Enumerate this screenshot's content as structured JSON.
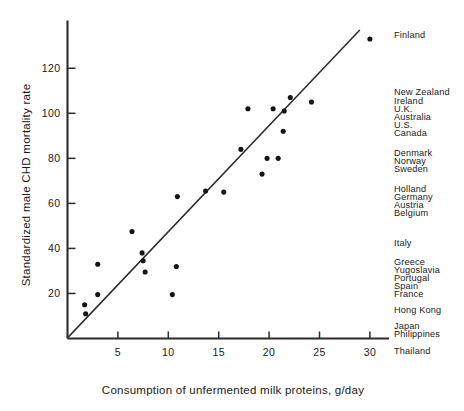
{
  "chart_data": {
    "type": "scatter",
    "title": "",
    "xlabel": "Consumption of unfermented milk proteins, g/day",
    "ylabel": "Standardized male CHD mortality rate",
    "xlim": [
      0,
      33
    ],
    "ylim": [
      0,
      140
    ],
    "xticks": [
      5,
      10,
      15,
      20,
      25,
      30
    ],
    "yticks": [
      20,
      40,
      60,
      80,
      100,
      120
    ],
    "grid": false,
    "legend": "none",
    "annotation_column_title": "",
    "points": [
      {
        "x": 1.7,
        "y": 15
      },
      {
        "x": 1.8,
        "y": 11
      },
      {
        "x": 3.0,
        "y": 19.5
      },
      {
        "x": 3.0,
        "y": 33
      },
      {
        "x": 6.4,
        "y": 47.5
      },
      {
        "x": 7.4,
        "y": 38
      },
      {
        "x": 7.5,
        "y": 34.5
      },
      {
        "x": 7.7,
        "y": 29.5
      },
      {
        "x": 10.4,
        "y": 19.5
      },
      {
        "x": 10.8,
        "y": 32
      },
      {
        "x": 10.9,
        "y": 63
      },
      {
        "x": 13.7,
        "y": 65.5
      },
      {
        "x": 15.5,
        "y": 65
      },
      {
        "x": 17.2,
        "y": 84
      },
      {
        "x": 17.9,
        "y": 102
      },
      {
        "x": 19.3,
        "y": 73
      },
      {
        "x": 19.8,
        "y": 80
      },
      {
        "x": 20.4,
        "y": 102
      },
      {
        "x": 20.9,
        "y": 80
      },
      {
        "x": 21.4,
        "y": 92
      },
      {
        "x": 21.5,
        "y": 101
      },
      {
        "x": 22.1,
        "y": 107
      },
      {
        "x": 24.2,
        "y": 105
      },
      {
        "x": 30.0,
        "y": 133
      }
    ],
    "trend_line": {
      "x0": 0.05,
      "y0": 0.5,
      "x1": 29.0,
      "y1": 137
    },
    "country_labels": [
      {
        "name": "Finland",
        "top": 31
      },
      {
        "name": "New Zealand",
        "top": 88
      },
      {
        "name": "Ireland",
        "top": 97
      },
      {
        "name": "U.K.",
        "top": 105
      },
      {
        "name": "Australia",
        "top": 113
      },
      {
        "name": "U.S.",
        "top": 121
      },
      {
        "name": "Canada",
        "top": 129
      },
      {
        "name": "Denmark",
        "top": 149
      },
      {
        "name": "Norway",
        "top": 157
      },
      {
        "name": "Sweden",
        "top": 165
      },
      {
        "name": "Holland",
        "top": 185
      },
      {
        "name": "Germany",
        "top": 193
      },
      {
        "name": "Austria",
        "top": 201
      },
      {
        "name": "Belgium",
        "top": 209
      },
      {
        "name": "Italy",
        "top": 239
      },
      {
        "name": "Greece",
        "top": 258
      },
      {
        "name": "Yugoslavia",
        "top": 266
      },
      {
        "name": "Portugal",
        "top": 274
      },
      {
        "name": "Spain",
        "top": 282
      },
      {
        "name": "France",
        "top": 290
      },
      {
        "name": "Hong Kong",
        "top": 306
      },
      {
        "name": "Japan",
        "top": 322
      },
      {
        "name": "Philippines",
        "top": 330
      },
      {
        "name": "Thailand",
        "top": 347
      }
    ],
    "colors": {
      "point": "#151515",
      "line": "#2b2b2b",
      "axis": "#2b2b2b",
      "text": "#1a1a1a",
      "background": "#ffffff"
    }
  }
}
